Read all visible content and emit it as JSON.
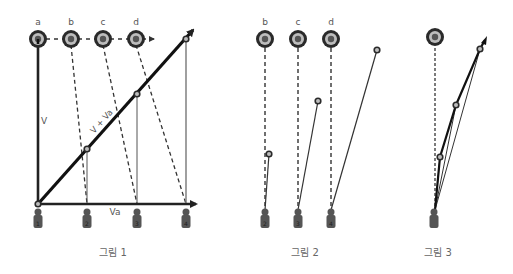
{
  "figures": [
    {
      "caption": "그림 1",
      "circle_labels": [
        "a",
        "b",
        "c",
        "d"
      ],
      "vector_labels": {
        "vertical": "V",
        "horizontal": "Va",
        "diagonal": "V + Va"
      },
      "weights": [
        "1",
        "2",
        "3",
        "4"
      ]
    },
    {
      "caption": "그림 2",
      "circle_labels": [
        "b",
        "c",
        "d"
      ],
      "weights": [
        "2",
        "3",
        "4"
      ]
    },
    {
      "caption": "그림 3"
    }
  ],
  "colors": {
    "stroke": "#222222",
    "ring": "#333333",
    "ring_inner": "#b5b5b5",
    "dot": "#555555",
    "weight": "#555555"
  }
}
